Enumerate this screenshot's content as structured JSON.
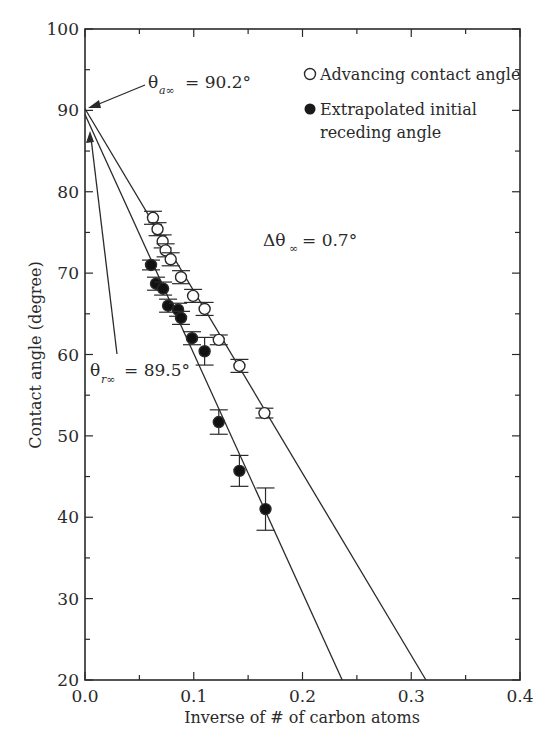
{
  "chart_data": {
    "type": "scatter",
    "title": "",
    "xlabel": "Inverse of # of carbon atoms",
    "ylabel": "Contact angle (degree)",
    "xlim": [
      0.0,
      0.4
    ],
    "ylim": [
      20,
      100
    ],
    "x_ticks": [
      "0.0",
      "0.1",
      "0.2",
      "0.3",
      "0.4"
    ],
    "y_ticks": [
      "20",
      "30",
      "40",
      "50",
      "60",
      "70",
      "80",
      "90",
      "100"
    ],
    "grid": false,
    "legend_position": "upper right",
    "series": [
      {
        "name": "Advancing contact angle",
        "marker": "open-circle",
        "points": [
          {
            "x": 0.0625,
            "y": 76.8,
            "err": 0.8
          },
          {
            "x": 0.0667,
            "y": 75.4,
            "err": 0.8
          },
          {
            "x": 0.0714,
            "y": 73.9,
            "err": 0.8
          },
          {
            "x": 0.0741,
            "y": 72.8,
            "err": 0.8
          },
          {
            "x": 0.0788,
            "y": 71.7,
            "err": 0.8
          },
          {
            "x": 0.0883,
            "y": 69.5,
            "err": 0.8
          },
          {
            "x": 0.0994,
            "y": 67.2,
            "err": 0.8
          },
          {
            "x": 0.11,
            "y": 65.6,
            "err": 0.8
          },
          {
            "x": 0.123,
            "y": 61.8,
            "err": 0.6
          },
          {
            "x": 0.142,
            "y": 58.6,
            "err": 0.8
          },
          {
            "x": 0.165,
            "y": 52.8,
            "err": 0.6
          }
        ],
        "fit_line": {
          "intercept": 90.2,
          "x_at_y20": 0.3135
        }
      },
      {
        "name": "Extrapolated initial receding angle",
        "marker": "filled-circle",
        "points": [
          {
            "x": 0.0607,
            "y": 71.0,
            "err": 0.6
          },
          {
            "x": 0.0653,
            "y": 68.7,
            "err": 0.8
          },
          {
            "x": 0.0718,
            "y": 68.1,
            "err": 0.8
          },
          {
            "x": 0.0764,
            "y": 66.0,
            "err": 0.8
          },
          {
            "x": 0.0856,
            "y": 65.5,
            "err": 0.8
          },
          {
            "x": 0.0883,
            "y": 64.5,
            "err": 0.8
          },
          {
            "x": 0.0984,
            "y": 62.0,
            "err": 0.8
          },
          {
            "x": 0.11,
            "y": 60.4,
            "err": 1.7
          },
          {
            "x": 0.123,
            "y": 51.7,
            "err": 1.5
          },
          {
            "x": 0.142,
            "y": 45.7,
            "err": 1.9
          },
          {
            "x": 0.166,
            "y": 41.0,
            "err": 2.6
          }
        ],
        "fit_line": {
          "intercept": 89.5,
          "x_at_y20": 0.2365
        }
      }
    ],
    "annotations": [
      {
        "text": "θa∞ = 90.2°",
        "symbol": "θ",
        "subscript": "a∞",
        "value": "= 90.2°",
        "points_to": {
          "x": 0.0,
          "y": 90.2
        }
      },
      {
        "text": "θr∞ = 89.5°",
        "symbol": "θ",
        "subscript": "r∞",
        "value": "= 89.5°",
        "points_to": {
          "x": 0.0,
          "y": 88.0
        }
      },
      {
        "text": "Δθ∞ = 0.7°",
        "symbol": "Δθ",
        "subscript": "∞",
        "value": "= 0.7°"
      }
    ]
  },
  "labels": {
    "xlabel": "Inverse of # of carbon atoms",
    "ylabel": "Contact angle (degree)",
    "legend_open": "Advancing contact angle",
    "legend_filled_line1": "Extrapolated initial",
    "legend_filled_line2": "receding angle",
    "anno_a_symbol": "θ",
    "anno_a_sub": "a∞",
    "anno_a_value": "= 90.2°",
    "anno_r_symbol": "θ",
    "anno_r_sub": "r∞",
    "anno_r_value": "= 89.5°",
    "anno_d_symbol": "Δθ",
    "anno_d_sub": "∞",
    "anno_d_value": "= 0.7°"
  },
  "colors": {
    "ink": "#2a2a2a",
    "background": "#ffffff"
  }
}
